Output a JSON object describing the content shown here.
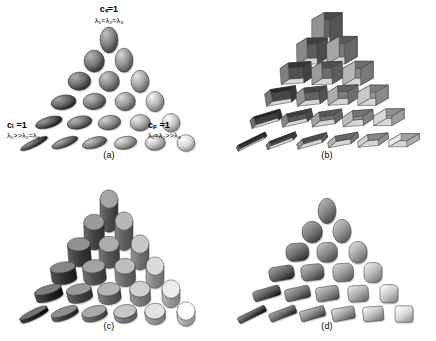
{
  "figure": {
    "background_color": "#ffffff",
    "panel_count": 4,
    "rows_per_triangle": 6,
    "shapes_per_triangle": 21
  },
  "annotations": {
    "apex": {
      "metric": "cₛ=1",
      "eigenvalues": "λ₁=λ₂=λ₃",
      "meaning": "spherical"
    },
    "left": {
      "metric": "cₗ =1",
      "eigenvalues": "λ₁>>λ₂=λ₃",
      "meaning": "linear"
    },
    "right": {
      "metric": "cₚ =1",
      "eigenvalues": "λ₁=λ₂>>λ₃",
      "meaning": "planar"
    }
  },
  "panels": [
    {
      "id": "a",
      "caption": "(a)",
      "glyph": "ellipsoid",
      "description": "smooth shaded ellipsoids"
    },
    {
      "id": "b",
      "caption": "(b)",
      "glyph": "cuboid",
      "description": "rectangular boxes / cuboids"
    },
    {
      "id": "c",
      "caption": "(c)",
      "glyph": "cylinder",
      "description": "cylinders and discs"
    },
    {
      "id": "d",
      "caption": "(d)",
      "glyph": "superquadric",
      "description": "superquadric rounded glyphs"
    }
  ],
  "colors": {
    "shape_light": "#d8d8d8",
    "shape_mid": "#9a9a9a",
    "shape_dark": "#4a4a4a",
    "shape_darkest": "#2b2b2b",
    "outline": "#3a3a3a",
    "text": "#000000"
  },
  "chart_data": {
    "type": "scatter",
    "xlabel": "",
    "ylabel": "",
    "grid": false,
    "legend_position": "none",
    "rows": [
      {
        "row": 0,
        "count": 1,
        "anisotropy": "isotropic"
      },
      {
        "row": 1,
        "count": 2,
        "anisotropy": "near-isotropic"
      },
      {
        "row": 2,
        "count": 3,
        "anisotropy": "mixed"
      },
      {
        "row": 3,
        "count": 4,
        "anisotropy": "mixed"
      },
      {
        "row": 4,
        "count": 5,
        "anisotropy": "strong"
      },
      {
        "row": 5,
        "count": 6,
        "anisotropy": "extreme"
      }
    ],
    "corner_metrics": [
      "c_l",
      "c_p",
      "c_s"
    ]
  }
}
